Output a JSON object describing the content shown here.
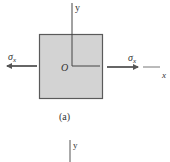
{
  "figure": {
    "panel_a": {
      "caption": "(a)",
      "origin_label": "O",
      "y_axis_label": "y",
      "x_axis_label": "x",
      "left_stress_label": "σx",
      "right_stress_label": "σx",
      "stress_symbol": "σ",
      "stress_subscript": "x"
    },
    "panel_b_partial": {
      "y_axis_label": "y"
    },
    "colors": {
      "element_fill": "#d3d3d3",
      "element_border": "#5a5a5a",
      "arrow": "#555555",
      "axis": "#444444",
      "text": "#333333"
    }
  }
}
